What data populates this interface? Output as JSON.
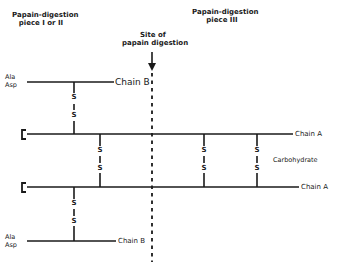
{
  "diagram": {
    "headers": {
      "piece_1_2_line1": "Papain-digestion",
      "piece_1_2_line2": "piece I or II",
      "piece_3_line1": "Papain-digestion",
      "piece_3_line2": "piece III",
      "site_line1": "Site of",
      "site_line2": "papain digestion"
    },
    "chains": {
      "top_chain_b": {
        "label": "Chain B",
        "n_term_1": "Ala",
        "n_term_2": "Asp"
      },
      "chain_a_upper": {
        "label": "Chain A"
      },
      "chain_a_lower": {
        "label": "Chain A"
      },
      "bottom_chain_b": {
        "label": "Chain B",
        "n_term_1": "Ala",
        "n_term_2": "Asp"
      }
    },
    "carbohydrate_label": "Carbohydrate",
    "disulfide_symbol": "S",
    "disulfide_bridges": [
      {
        "id": "b-to-a-upper",
        "x": 74
      },
      {
        "id": "a-a-left",
        "x": 100
      },
      {
        "id": "a-a-mid",
        "x": 204
      },
      {
        "id": "a-a-right",
        "x": 257
      },
      {
        "id": "a-lower-to-b",
        "x": 74
      }
    ]
  }
}
